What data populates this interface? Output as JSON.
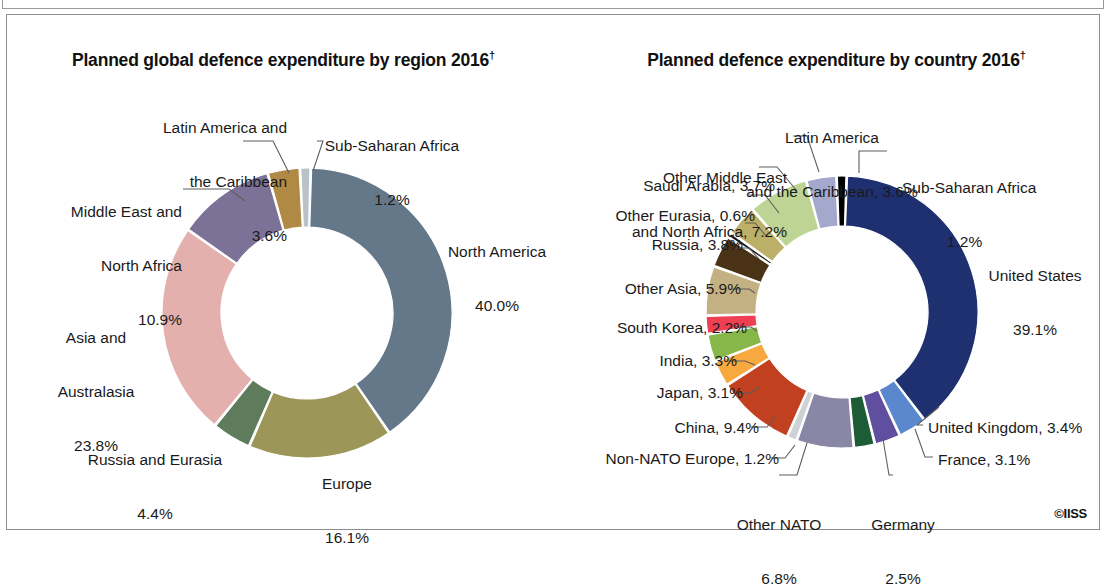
{
  "figure": {
    "copyright": "©IISS",
    "dagger": "†"
  },
  "chart_data": [
    {
      "type": "pie",
      "variant": "donut",
      "title": "Planned global defence expenditure by region 2016†",
      "title_plain": "Planned global defence expenditure by region 2016",
      "unit": "%",
      "legend": "none",
      "labels_inline": true,
      "categories": [
        "North America",
        "Europe",
        "Russia and Eurasia",
        "Asia and Australasia",
        "Middle East and North Africa",
        "Latin America and the Caribbean",
        "Sub-Saharan Africa"
      ],
      "values": [
        40.0,
        16.1,
        4.4,
        23.8,
        10.9,
        3.6,
        1.2
      ],
      "value_labels": [
        "40.0%",
        "16.1%",
        "4.4%",
        "23.8%",
        "10.9%",
        "3.6%",
        "1.2%"
      ],
      "colors": [
        "#64788a",
        "#9c9759",
        "#5e7b5b",
        "#e3b0ae",
        "#7c7197",
        "#b08a44",
        "#b9c2c7"
      ],
      "slice_labels": [
        {
          "name": "North America",
          "line1": "North America",
          "line2": "40.0%"
        },
        {
          "name": "Europe",
          "line1": "Europe",
          "line2": "16.1%"
        },
        {
          "name": "Russia and Eurasia",
          "line1": "Russia and Eurasia",
          "line2": "4.4%"
        },
        {
          "name": "Asia and Australasia",
          "line1": "Asia and",
          "line2": "Australasia",
          "line3": "23.8%"
        },
        {
          "name": "Middle East and North Africa",
          "line1": "Middle East and",
          "line2": "North Africa",
          "line3": "10.9%"
        },
        {
          "name": "Latin America and the Caribbean",
          "line1": "Latin America and",
          "line2": "the Caribbean",
          "line3": "3.6%"
        },
        {
          "name": "Sub-Saharan Africa",
          "line1": "Sub-Saharan Africa",
          "line2": "1.2%"
        }
      ]
    },
    {
      "type": "pie",
      "variant": "donut",
      "title": "Planned defence expenditure by country 2016†",
      "title_plain": "Planned defence expenditure by country 2016",
      "unit": "%",
      "legend": "none",
      "labels_inline": true,
      "categories": [
        "United States",
        "United Kingdom",
        "France",
        "Germany",
        "Other NATO",
        "Non-NATO Europe",
        "China",
        "Japan",
        "India",
        "South Korea",
        "Other Asia",
        "Russia",
        "Other Eurasia",
        "Saudi Arabia",
        "Other Middle East and North Africa",
        "Latin America and the Caribbean",
        "Sub-Saharan Africa"
      ],
      "values": [
        39.1,
        3.4,
        3.1,
        2.5,
        6.8,
        1.2,
        9.4,
        3.1,
        3.3,
        2.2,
        5.9,
        3.8,
        0.6,
        3.7,
        7.2,
        3.6,
        1.2
      ],
      "value_labels": [
        "39.1%",
        "3.4%",
        "3.1%",
        "2.5%",
        "6.8%",
        "1.2%",
        "9.4%",
        "3.1%",
        "3.3%",
        "2.2%",
        "5.9%",
        "3.8%",
        "0.6%",
        "3.7%",
        "7.2%",
        "3.6%",
        "1.2%"
      ],
      "colors": [
        "#1f3070",
        "#5b87cf",
        "#5f4f9e",
        "#1c5c36",
        "#8a86a5",
        "#cfd2d4",
        "#c0401f",
        "#f7a93f",
        "#86b748",
        "#ef3f52",
        "#c4b183",
        "#4a3217",
        "#1a1a1a",
        "#bcb069",
        "#bed494",
        "#a3a8cc",
        "#000000"
      ],
      "slice_labels": [
        {
          "name": "United States",
          "text": "United States",
          "value": "39.1%"
        },
        {
          "name": "United Kingdom",
          "text": "United Kingdom, 3.4%"
        },
        {
          "name": "France",
          "text": "France, 3.1%"
        },
        {
          "name": "Germany",
          "text": "Germany",
          "value": "2.5%"
        },
        {
          "name": "Other NATO",
          "text": "Other NATO",
          "value": "6.8%"
        },
        {
          "name": "Non-NATO Europe",
          "text": "Non-NATO Europe, 1.2%"
        },
        {
          "name": "China",
          "text": "China, 9.4%"
        },
        {
          "name": "Japan",
          "text": "Japan, 3.1%"
        },
        {
          "name": "India",
          "text": "India, 3.3%"
        },
        {
          "name": "South Korea",
          "text": "South Korea, 2.2%"
        },
        {
          "name": "Other Asia",
          "text": "Other Asia, 5.9%"
        },
        {
          "name": "Russia",
          "text": "Russia, 3.8%"
        },
        {
          "name": "Other Eurasia",
          "text": "Other Eurasia, 0.6%"
        },
        {
          "name": "Saudi Arabia",
          "text": "Saudi Arabia, 3.7%"
        },
        {
          "name": "Other Middle East and North Africa",
          "line1": "Other Middle East",
          "line2": "and North Africa, 7.2%"
        },
        {
          "name": "Latin America and the Caribbean",
          "line1": "Latin America",
          "line2": "and the Caribbean, 3.6%"
        },
        {
          "name": "Sub-Saharan Africa",
          "line1": "Sub-Saharan Africa",
          "line2": "1.2%"
        }
      ]
    }
  ],
  "left_labels": {
    "latin_l1": "Latin America and",
    "latin_l2": "the Caribbean",
    "latin_l3": "3.6%",
    "ssa_l1": "Sub-Saharan Africa",
    "ssa_l2": "1.2%",
    "mena_l1": "Middle East and",
    "mena_l2": "North Africa",
    "mena_l3": "10.9%",
    "na_l1": "North America",
    "na_l2": "40.0%",
    "asia_l1": "Asia and",
    "asia_l2": "Australasia",
    "asia_l3": "23.8%",
    "russia_l1": "Russia and Eurasia",
    "russia_l2": "4.4%",
    "europe_l1": "Europe",
    "europe_l2": "16.1%"
  },
  "right_labels": {
    "latin_l1": "Latin America",
    "latin_l2": "and the Caribbean, 3.6%",
    "ssa_l1": "Sub-Saharan Africa",
    "ssa_l2": "1.2%",
    "omena_l1": "Other Middle East",
    "omena_l2": "and North Africa, 7.2%",
    "saudi": "Saudi Arabia, 3.7%",
    "oeurasia": "Other Eurasia, 0.6%",
    "russia": "Russia, 3.8%",
    "oasia": "Other Asia, 5.9%",
    "skorea": "South Korea, 2.2%",
    "india": "India, 3.3%",
    "japan": "Japan, 3.1%",
    "china": "China, 9.4%",
    "nonnato": "Non-NATO Europe, 1.2%",
    "onato_l1": "Other NATO",
    "onato_l2": "6.8%",
    "germany_l1": "Germany",
    "germany_l2": "2.5%",
    "france": "France, 3.1%",
    "uk": "United Kingdom, 3.4%",
    "us_l1": "United States",
    "us_l2": "39.1%"
  }
}
